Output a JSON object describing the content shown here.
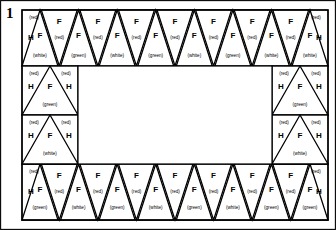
{
  "figure": {
    "number": "1",
    "type": "pieced-border-frame"
  },
  "legend": {
    "letter_f": "F",
    "letter_h": "H",
    "color_red": "(red)",
    "color_white": "(white)",
    "color_green": "(green)"
  },
  "layout": {
    "canvas_width": 336,
    "canvas_height": 230,
    "frame": {
      "x": 22,
      "y": 10,
      "width": 306,
      "height": 210
    },
    "border_band": 56,
    "top_strip": {
      "x": 22,
      "y": 10,
      "width": 306,
      "height": 56
    },
    "bottom_strip": {
      "x": 22,
      "y": 164,
      "width": 306,
      "height": 56
    },
    "left_strip": {
      "x": 22,
      "y": 66,
      "width": 56,
      "height": 98
    },
    "right_strip": {
      "x": 272,
      "y": 66,
      "width": 56,
      "height": 98
    },
    "center_void": {
      "x": 78,
      "y": 66,
      "width": 194,
      "height": 98
    }
  },
  "top_strip": {
    "name": "top-border-strip",
    "end_left": {
      "corner_letter": "H",
      "corner_color": "(red)"
    },
    "end_right": {
      "corner_letter": "H",
      "corner_color": "(red)"
    },
    "up_triangles": [
      {
        "letter": "F",
        "color": "(white)"
      },
      {
        "letter": "F",
        "color": "(green)"
      },
      {
        "letter": "F",
        "color": "(white)"
      },
      {
        "letter": "F",
        "color": "(green)"
      },
      {
        "letter": "F",
        "color": "(white)"
      },
      {
        "letter": "F",
        "color": "(green)"
      },
      {
        "letter": "F",
        "color": "(white)"
      },
      {
        "letter": "F",
        "color": "(white)"
      }
    ],
    "down_triangles": [
      {
        "letter": "F",
        "color": "(red)"
      },
      {
        "letter": "F",
        "color": "(red)"
      },
      {
        "letter": "F",
        "color": "(red)"
      },
      {
        "letter": "F",
        "color": "(red)"
      },
      {
        "letter": "F",
        "color": "(red)"
      },
      {
        "letter": "F",
        "color": "(red)"
      },
      {
        "letter": "F",
        "color": "(red)"
      }
    ]
  },
  "bottom_strip": {
    "name": "bottom-border-strip",
    "end_left": {
      "corner_letter": "H",
      "corner_color": "(red)"
    },
    "end_right": {
      "corner_letter": "H",
      "corner_color": "(red)"
    },
    "up_triangles": [
      {
        "letter": "F",
        "color": "(green)"
      },
      {
        "letter": "F",
        "color": "(white)"
      },
      {
        "letter": "F",
        "color": "(green)"
      },
      {
        "letter": "F",
        "color": "(white)"
      },
      {
        "letter": "F",
        "color": "(green)"
      },
      {
        "letter": "F",
        "color": "(white)"
      },
      {
        "letter": "F",
        "color": "(green)"
      },
      {
        "letter": "F",
        "color": "(green)"
      }
    ],
    "down_triangles": [
      {
        "letter": "F",
        "color": "(red)"
      },
      {
        "letter": "F",
        "color": "(red)"
      },
      {
        "letter": "F",
        "color": "(red)"
      },
      {
        "letter": "F",
        "color": "(red)"
      },
      {
        "letter": "F",
        "color": "(red)"
      },
      {
        "letter": "F",
        "color": "(red)"
      },
      {
        "letter": "F",
        "color": "(red)"
      }
    ]
  },
  "left_strip": {
    "name": "left-border-strip",
    "cells": [
      {
        "left_letter": "H",
        "center_letter": "F",
        "right_letter": "H",
        "left_color": "(red)",
        "right_color": "(red)",
        "bottom_color": "(green)"
      },
      {
        "left_letter": "H",
        "center_letter": "F",
        "right_letter": "H",
        "left_color": "(red)",
        "right_color": "(red)",
        "bottom_color": "(white)"
      }
    ]
  },
  "right_strip": {
    "name": "right-border-strip",
    "cells": [
      {
        "left_letter": "H",
        "center_letter": "F",
        "right_letter": "H",
        "left_color": "(red)",
        "right_color": "(red)",
        "bottom_color": "(green)"
      },
      {
        "left_letter": "H",
        "center_letter": "F",
        "right_letter": "H",
        "left_color": "(red)",
        "right_color": "(red)",
        "bottom_color": "(white)"
      }
    ]
  }
}
